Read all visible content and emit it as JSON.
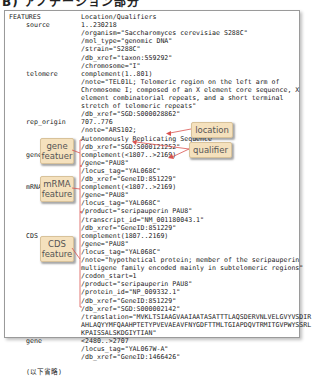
{
  "heading": "B) アノテーション部分",
  "header": {
    "features_label": "FEATURES",
    "location_label": "Location/Qualifiers"
  },
  "features": [
    {
      "key": "source",
      "lines": [
        "1..230218",
        "/organism=\"Saccharomyces cerevisiae S288C\"",
        "/mol_type=\"genomic DNA\"",
        "/strain=\"S288C\"",
        "/db_xref=\"taxon:559292\"",
        "/chromosome=\"I\""
      ]
    },
    {
      "key": "telomere",
      "lines": [
        "complement(1..801)",
        "/note=\"TEL01L; Telomeric region on the left arm of",
        "Chromosome I; composed of an X element core sequence, X",
        "element combinatorial repeats, and a short terminal",
        "stretch of telomeric repeats\"",
        "/db_xref=\"SGD:S000028862\""
      ]
    },
    {
      "key": "rep_origin",
      "lines": [
        "707..776",
        "/note=\"ARS102;",
        "Autonomously Replicating Sequence\"",
        "/db_xref=\"SGD:S000121252\""
      ]
    },
    {
      "key": "gene",
      "lines": [
        "complement(<1807..>2169)",
        "/gene=\"PAU8\"",
        "/locus_tag=\"YAL068C\"",
        "/db_xref=\"GeneID:851229\""
      ]
    },
    {
      "key": "mRNA",
      "lines": [
        "complement(<1807..>2169)",
        "/gene=\"PAU8\"",
        "/locus_tag=\"YAL068C\"",
        "/product=\"seripauperin PAU8\"",
        "/transcript_id=\"NM_001180043.1\"",
        "/db_xref=\"GeneID:851229\""
      ]
    },
    {
      "key": "CDS",
      "lines": [
        "complement(1807..2169)",
        "/gene=\"PAU8\"",
        "/locus_tag=\"YAL068C\"",
        "/note=\"hypothetical protein; member of the seripauperin",
        "multigene family encoded mainly in subtelomeric regions\"",
        "/codon_start=1",
        "/product=\"seripauperin PAU8\"",
        "/protein_id=\"NP_009332.1\"",
        "/db_xref=\"GeneID:851229\"",
        "/db_xref=\"SGD:S000002142\"",
        "/translation=\"MVKLTSIAAGVAAIAATASATTTLAQSDERVNLVELGVYVSDIR",
        "AHLAQYYMFQAAHPTETYPVEVAEAVFNYGDFTTMLTGIAPDQVTRMITGVPWYSSRL",
        "KPAISSALSKDGIYTIAN\""
      ]
    },
    {
      "key": "gene",
      "lines": [
        "<2480..>2707",
        "/locus_tag=\"YAL067W-A\"",
        "/db_xref=\"GeneID:1466426\""
      ]
    }
  ],
  "omitted_note": "(以下省略)",
  "callouts": {
    "location": "location",
    "qualifier": "qualifier",
    "gene_feature_line1": "gene",
    "gene_feature_line2": "featuer",
    "mrna_feature_line1": "mRMA",
    "mrna_feature_line2": "feature",
    "cds_feature_line1": "CDS",
    "cds_feature_line2": "feature"
  },
  "colors": {
    "callout_bg": "#f5e1bd",
    "arrow_red": "#d9534f",
    "border": "#9a9a9a"
  }
}
